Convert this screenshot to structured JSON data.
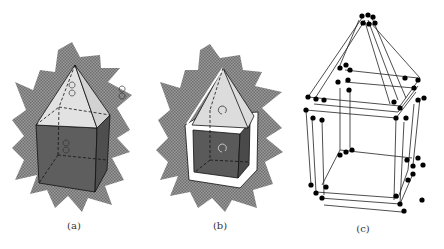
{
  "figure": {
    "panels": [
      {
        "id": "a",
        "caption": "(a)",
        "description": "Pyramid-topped box on hatched star-shaped background"
      },
      {
        "id": "b",
        "caption": "(b)",
        "description": "Same solid with thickened white boundary frame"
      },
      {
        "id": "c",
        "caption": "(c)",
        "description": "Wireframe graph with vertices (black dots) and directed edges"
      }
    ],
    "colors": {
      "hatch": "#8a8a8a",
      "box_face": "#5a5a5a",
      "pyramid_face": "#dcdcdc",
      "vertex": "#000000",
      "edge": "#222222"
    }
  }
}
